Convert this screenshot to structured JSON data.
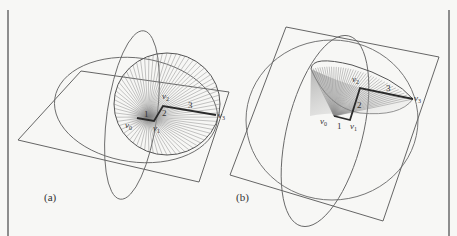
{
  "figure": {
    "panels": [
      {
        "id": "a",
        "label": "(a)",
        "vertices": {
          "v0": "v",
          "v0_sub": "0",
          "v1": "v",
          "v1_sub": "1",
          "v2": "v",
          "v2_sub": "2",
          "v3": "v",
          "v3_sub": "3"
        },
        "edge_lengths": {
          "e01": "1",
          "e12": "2",
          "e23": "3"
        }
      },
      {
        "id": "b",
        "label": "(b)",
        "vertices": {
          "v0": "v",
          "v0_sub": "0",
          "v1": "v",
          "v1_sub": "1",
          "v2": "v",
          "v2_sub": "2",
          "v3": "v",
          "v3_sub": "3"
        },
        "edge_lengths": {
          "e01": "1",
          "e12": "2",
          "e23": "3"
        }
      }
    ],
    "colors": {
      "line": "#555555",
      "hatch": "#8a8a8a",
      "polyline": "#2a2a2a",
      "background": "#f7f7f5",
      "border": "#8d8d8d"
    }
  }
}
